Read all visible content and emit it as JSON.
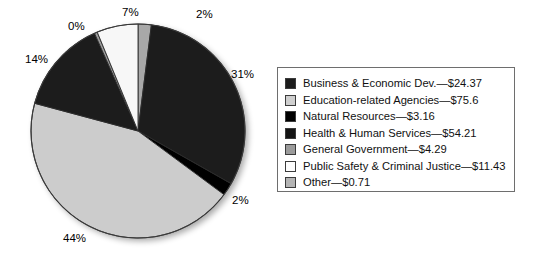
{
  "chart_data": {
    "type": "pie",
    "title": "",
    "categories": [
      "Business & Economic Dev.",
      "Education-related Agencies",
      "Natural Resources",
      "Health & Human Services",
      "General Government",
      "Public Safety & Criminal Justice",
      "Other"
    ],
    "values": [
      24.37,
      75.6,
      3.16,
      54.21,
      4.29,
      11.43,
      0.71
    ],
    "value_prefix": "$",
    "percent_labels": [
      "31%",
      "44%",
      "2%",
      "14%",
      "0%",
      "7%",
      "2%"
    ],
    "slice_colors": [
      "#1c1c1c",
      "#cccccc",
      "#000000",
      "#1c1c1c",
      "#9b9b9b",
      "#f7f7f7",
      "#a8a8a8"
    ],
    "legend_position": "right",
    "grid": false,
    "xlabel": "",
    "ylabel": "",
    "slices": [
      {
        "name": "other-slice",
        "label": "Other",
        "percent": "2%",
        "value": "$0.71",
        "color": "#a8a8a8",
        "start_deg": 0,
        "end_deg": 7.2,
        "label_x": 196,
        "label_y": 8
      },
      {
        "name": "business-economic-dev-slice",
        "label": "Business & Economic Dev.",
        "percent": "31%",
        "value": "$24.37",
        "color": "#1c1c1c",
        "start_deg": 7.2,
        "end_deg": 119.5,
        "label_x": 231,
        "label_y": 68
      },
      {
        "name": "natural-resources-slice",
        "label": "Natural Resources",
        "percent": "2%",
        "value": "$3.16",
        "color": "#000000",
        "start_deg": 119.5,
        "end_deg": 126.5,
        "label_x": 232,
        "label_y": 194
      },
      {
        "name": "education-related-agencies-slice",
        "label": "Education-related Agencies",
        "percent": "44%",
        "value": "$75.6",
        "color": "#cccccc",
        "start_deg": 126.5,
        "end_deg": 285.0,
        "label_x": 63,
        "label_y": 232
      },
      {
        "name": "health-human-services-slice",
        "label": "Health & Human Services",
        "percent": "14%",
        "value": "$54.21",
        "color": "#1c1c1c",
        "start_deg": 285.0,
        "end_deg": 336.0,
        "label_x": 25,
        "label_y": 53
      },
      {
        "name": "general-government-slice",
        "label": "General Government",
        "percent": "0%",
        "value": "$4.29",
        "color": "#9b9b9b",
        "start_deg": 336.0,
        "end_deg": 337.6,
        "label_x": 68,
        "label_y": 20
      },
      {
        "name": "public-safety-criminal-justice-slice",
        "label": "Public Safety & Criminal Justice",
        "percent": "7%",
        "value": "$11.43",
        "color": "#f7f7f7",
        "start_deg": 337.6,
        "end_deg": 360,
        "label_x": 122,
        "label_y": 6
      }
    ],
    "geometry": {
      "center_x": 138,
      "center_y": 131,
      "radius": 107
    }
  },
  "legend": {
    "items": [
      {
        "label": "Business & Economic Dev.—$24.37",
        "color": "#1c1c1c",
        "swatch_name": "swatch-business-economic-dev"
      },
      {
        "label": "Education-related Agencies—$75.6",
        "color": "#cfcfcf",
        "swatch_name": "swatch-education-related-agencies"
      },
      {
        "label": "Natural Resources—$3.16",
        "color": "#000000",
        "swatch_name": "swatch-natural-resources"
      },
      {
        "label": "Health & Human Services—$54.21",
        "color": "#141414",
        "swatch_name": "swatch-health-human-services"
      },
      {
        "label": "General Government—$4.29",
        "color": "#9b9b9b",
        "swatch_name": "swatch-general-government"
      },
      {
        "label": "Public Safety & Criminal Justice—$11.43",
        "color": "#fdfdfd",
        "swatch_name": "swatch-public-safety-criminal-justice"
      },
      {
        "label": "Other—$0.71",
        "color": "#b4b4b4",
        "swatch_name": "swatch-other"
      }
    ]
  }
}
